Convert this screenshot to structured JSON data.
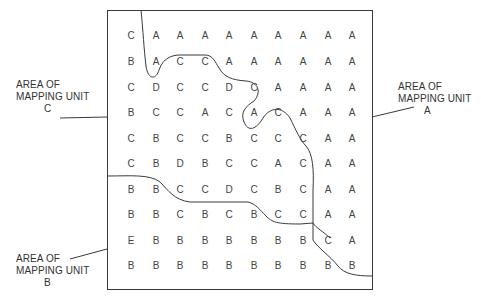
{
  "diagram": {
    "colors": {
      "ink": "#3a3a3a",
      "background": "#ffffff"
    },
    "grid": {
      "rows": [
        [
          "C",
          "A",
          "A",
          "A",
          "A",
          "A",
          "A",
          "A",
          "A",
          "A"
        ],
        [
          "B",
          "A",
          "C",
          "C",
          "A",
          "A",
          "A",
          "A",
          "A",
          "A"
        ],
        [
          "C",
          "D",
          "C",
          "C",
          "D",
          "C",
          "A",
          "A",
          "A",
          "A"
        ],
        [
          "B",
          "C",
          "C",
          "A",
          "C",
          "A",
          "C",
          "A",
          "A",
          "A"
        ],
        [
          "C",
          "B",
          "C",
          "C",
          "B",
          "C",
          "C",
          "C",
          "A",
          "A"
        ],
        [
          "C",
          "B",
          "D",
          "B",
          "C",
          "C",
          "A",
          "C",
          "A",
          "A"
        ],
        [
          "B",
          "B",
          "C",
          "C",
          "D",
          "C",
          "B",
          "C",
          "A",
          "A"
        ],
        [
          "B",
          "B",
          "C",
          "B",
          "C",
          "B",
          "C",
          "C",
          "A",
          "A"
        ],
        [
          "E",
          "B",
          "B",
          "B",
          "B",
          "B",
          "B",
          "B",
          "C",
          "A"
        ],
        [
          "B",
          "B",
          "B",
          "B",
          "B",
          "B",
          "B",
          "B",
          "B",
          "B"
        ]
      ]
    },
    "labels": {
      "unit_c": {
        "line1": "AREA OF",
        "line2": "MAPPING UNIT",
        "line3": "C"
      },
      "unit_a": {
        "line1": "AREA OF",
        "line2": "MAPPING UNIT",
        "line3": "A"
      },
      "unit_b": {
        "line1": "AREA OF",
        "line2": "MAPPING UNIT",
        "line3": "B"
      }
    }
  }
}
